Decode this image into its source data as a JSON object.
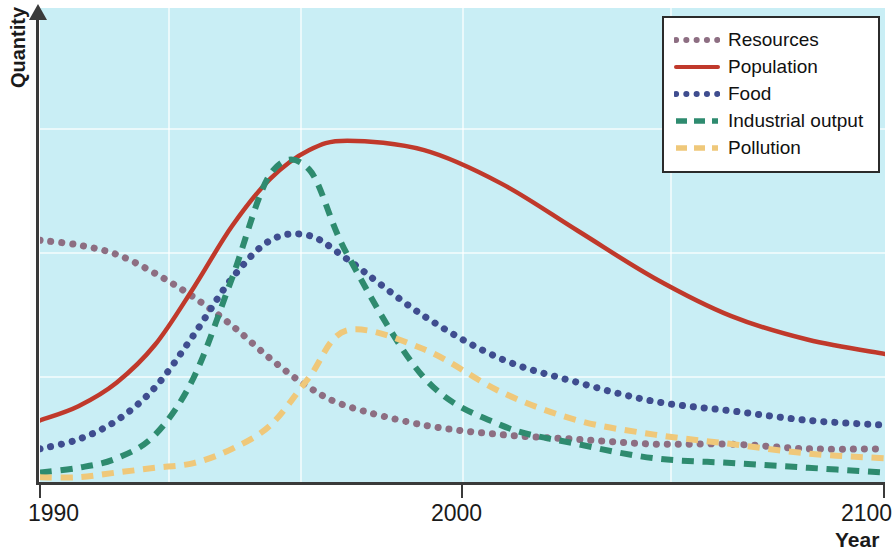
{
  "chart_data": {
    "type": "line",
    "title": "",
    "xlabel": "Year",
    "ylabel": "Quantity",
    "xlim": [
      1990,
      2100
    ],
    "ylim": [
      0,
      100
    ],
    "xticks": [
      "1990",
      "2000",
      "2100"
    ],
    "yticks": [],
    "grid": true,
    "legend_position": "top-right",
    "background_color": "#c9eef5",
    "x": [
      1990,
      1995,
      2000,
      2005,
      2010,
      2015,
      2020,
      2025,
      2030,
      2040,
      2050,
      2060,
      2070,
      2080,
      2090,
      2100
    ],
    "series": [
      {
        "name": "Resources",
        "color": "#8d6e82",
        "style": "dotted",
        "values": [
          51,
          50,
          48,
          44,
          39,
          33,
          26,
          20,
          16,
          12,
          10,
          9,
          8,
          8,
          7,
          7
        ]
      },
      {
        "name": "Population",
        "color": "#c0392b",
        "style": "solid",
        "values": [
          13,
          16,
          21,
          29,
          41,
          54,
          64,
          70,
          72,
          70,
          63,
          53,
          43,
          35,
          30,
          27
        ]
      },
      {
        "name": "Food",
        "color": "#3f4d8f",
        "style": "dotted",
        "values": [
          7,
          9,
          13,
          20,
          31,
          43,
          51,
          52,
          47,
          35,
          26,
          21,
          17,
          15,
          13,
          12
        ]
      },
      {
        "name": "Industrial output",
        "color": "#2e8b6f",
        "style": "dashed",
        "values": [
          2,
          3,
          5,
          10,
          22,
          43,
          65,
          66,
          48,
          22,
          12,
          8,
          5,
          4,
          3,
          2
        ]
      },
      {
        "name": "Pollution",
        "color": "#efc87a",
        "style": "dashed",
        "values": [
          1,
          1,
          2,
          3,
          4,
          7,
          12,
          22,
          32,
          28,
          19,
          13,
          10,
          8,
          6,
          5
        ]
      }
    ]
  },
  "axes": {
    "y_title": "Quantity",
    "x_title": "Year",
    "x_tick_labels": [
      "1990",
      "2000",
      "2100"
    ]
  },
  "legend": {
    "items": [
      {
        "label": "Resources"
      },
      {
        "label": "Population"
      },
      {
        "label": "Food"
      },
      {
        "label": "Industrial output"
      },
      {
        "label": "Pollution"
      }
    ]
  }
}
